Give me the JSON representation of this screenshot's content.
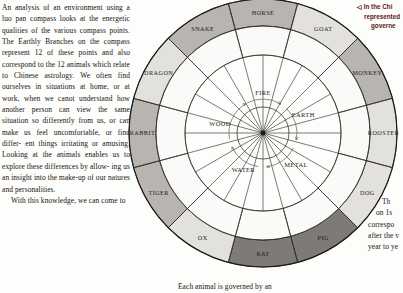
{
  "document": {
    "left_column": [
      "An analysis of an environment using a",
      "luo pan compass looks at the energetic",
      "qualities of the various compass",
      "points. The Earthly Branches on",
      "the compass represent 12 of these",
      "points and also correspond to",
      "the 12 animals which relate to",
      "Chinese astrology. We often",
      "find ourselves in situations at",
      "home, or at work, when we",
      "canot understand how",
      "another person can view the",
      "same  situation so differently",
      "from us, or can make us feel",
      "uncomfortable, or find differ-",
      "ent things irritating or amusing.",
      "Looking at the animals enables us",
      "to explore these differences by allow-",
      "ing us an insight into the make-up of",
      "our natures and personalities."
    ],
    "left_column_para2": "With this knowledge, we can come to",
    "bottom_center_text": "Each animal is governed by an",
    "right_column": [
      "Th",
      "on 1s",
      "correspo",
      "after the v",
      "year to ye"
    ],
    "caption": [
      "◁ In the Chi",
      "represented",
      "governe"
    ]
  },
  "compass": {
    "animals": [
      {
        "label": "HORSE",
        "shade": "mid"
      },
      {
        "label": "GOAT",
        "shade": "light"
      },
      {
        "label": "MONKEY",
        "shade": "mid"
      },
      {
        "label": "ROOSTER",
        "shade": "light"
      },
      {
        "label": "DOG",
        "shade": "light"
      },
      {
        "label": "PIG",
        "shade": "dark"
      },
      {
        "label": "RAT",
        "shade": "dark"
      },
      {
        "label": "OX",
        "shade": "light"
      },
      {
        "label": "TIGER",
        "shade": "mid"
      },
      {
        "label": "RABBIT",
        "shade": "mid"
      },
      {
        "label": "DRAGON",
        "shade": "light"
      },
      {
        "label": "SNAKE",
        "shade": "mid"
      }
    ],
    "elements": [
      {
        "label": "FIRE"
      },
      {
        "label": "EARTH"
      },
      {
        "label": "METAL"
      },
      {
        "label": "WATER"
      },
      {
        "label": "WOOD"
      }
    ],
    "colors": {
      "shade_light": "#e3e1dd",
      "shade_mid": "#b8b5b0",
      "shade_dark": "#7e7b76",
      "inner_ring": "#fafaf8",
      "core": "#ffffff",
      "stroke": "#2a2724",
      "caption_accent": "#5d1410"
    }
  }
}
